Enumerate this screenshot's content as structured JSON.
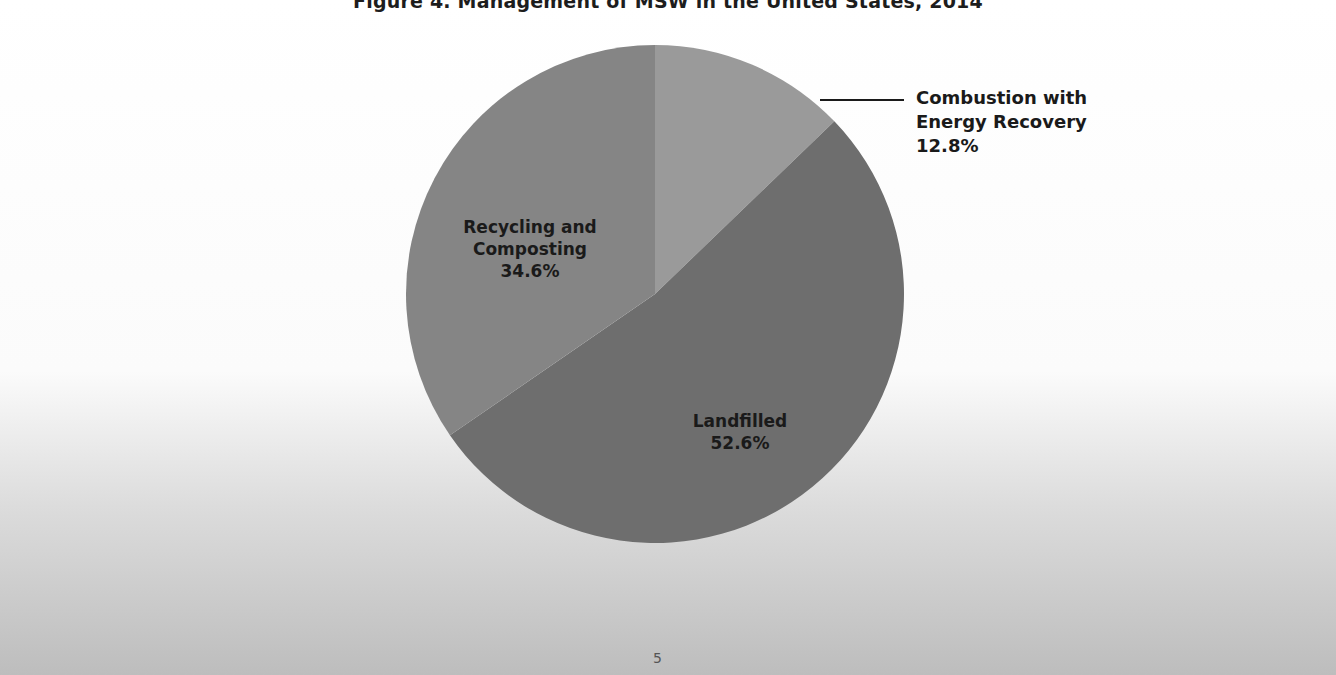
{
  "figure": {
    "title": "Figure 4. Management of MSW in the United States, 2014"
  },
  "slices": [
    {
      "label_line1": "Combustion with",
      "label_line2": "Energy Recovery",
      "value_label": "12.8%",
      "color": "#9a9a9a"
    },
    {
      "label_line1": "Landfilled",
      "label_line2": "",
      "value_label": "52.6%",
      "color": "#6e6e6e"
    },
    {
      "label_line1": "Recycling and",
      "label_line2": "Composting",
      "value_label": "34.6%",
      "color": "#858585"
    }
  ],
  "page": {
    "number": "5"
  },
  "chart_data": {
    "type": "pie",
    "title": "Figure 4. Management of MSW in the United States, 2014",
    "categories": [
      "Combustion with Energy Recovery",
      "Landfilled",
      "Recycling and Composting"
    ],
    "values": [
      12.8,
      52.6,
      34.6
    ],
    "units": "%",
    "start_angle": "12 o'clock, clockwise",
    "colors": [
      "#9a9a9a",
      "#6e6e6e",
      "#858585"
    ],
    "legend": "none (direct labels; Combustion label with leader line)"
  }
}
